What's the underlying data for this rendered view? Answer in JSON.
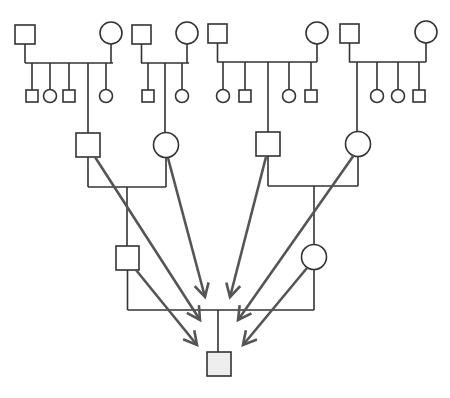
{
  "diagram": {
    "type": "pedigree",
    "colors": {
      "line": "#333333",
      "arrow": "#555555",
      "proband_fill": "#eeeeee",
      "background": "#ffffff"
    },
    "generation1": [
      {
        "id": "f1",
        "father": {
          "x": 15,
          "y": 25,
          "w": 20,
          "h": 19
        },
        "mother": {
          "cx": 111,
          "cy": 33,
          "r": 11
        },
        "sibline": {
          "y": 63,
          "x1": 25,
          "x2": 113
        },
        "children": [
          {
            "type": "male",
            "x": 32
          },
          {
            "type": "female",
            "x": 50
          },
          {
            "type": "male",
            "x": 69
          },
          {
            "type": "link",
            "x": 88
          },
          {
            "type": "female",
            "x": 106
          }
        ]
      },
      {
        "id": "f2",
        "father": {
          "x": 132,
          "y": 25,
          "w": 19,
          "h": 19
        },
        "mother": {
          "cx": 187,
          "cy": 33,
          "r": 11
        },
        "sibline": {
          "y": 63,
          "x1": 141,
          "x2": 189
        },
        "children": [
          {
            "type": "male",
            "x": 148
          },
          {
            "type": "link",
            "x": 165
          },
          {
            "type": "female",
            "x": 182
          }
        ]
      },
      {
        "id": "f3",
        "father": {
          "x": 208,
          "y": 24,
          "w": 19,
          "h": 19
        },
        "mother": {
          "cx": 317,
          "cy": 33,
          "r": 11
        },
        "sibline": {
          "y": 62,
          "x1": 217,
          "x2": 317
        },
        "children": [
          {
            "type": "female",
            "x": 223
          },
          {
            "type": "male",
            "x": 245
          },
          {
            "type": "link",
            "x": 268
          },
          {
            "type": "female",
            "x": 289
          },
          {
            "type": "male",
            "x": 311
          }
        ]
      },
      {
        "id": "f4",
        "father": {
          "x": 340,
          "y": 24,
          "w": 19,
          "h": 19
        },
        "mother": {
          "cx": 426,
          "cy": 32,
          "r": 11
        },
        "sibline": {
          "y": 62,
          "x1": 349,
          "x2": 426
        },
        "children": [
          {
            "type": "link",
            "x": 357
          },
          {
            "type": "female",
            "x": 377
          },
          {
            "type": "female",
            "x": 398
          },
          {
            "type": "male",
            "x": 419
          }
        ]
      }
    ],
    "generation2": {
      "left": {
        "father": {
          "x": 76,
          "y": 133,
          "w": 24,
          "h": 24
        },
        "mother": {
          "cx": 166,
          "cy": 145,
          "r": 12.5
        },
        "line_y": 187,
        "drop_x": 127
      },
      "right": {
        "father": {
          "x": 256,
          "y": 132,
          "w": 24,
          "h": 24
        },
        "mother": {
          "cx": 358,
          "cy": 144,
          "r": 12.5
        },
        "line_y": 186,
        "drop_x": 314
      }
    },
    "generation3": {
      "father": {
        "x": 116,
        "y": 246,
        "w": 23,
        "h": 24
      },
      "mother": {
        "cx": 314,
        "cy": 257,
        "r": 12.5
      },
      "line_y": 310,
      "drop_x": 218
    },
    "proband": {
      "x": 207,
      "y": 352,
      "w": 24,
      "h": 24,
      "label": "proband"
    },
    "arrows": [
      {
        "from": [
          95,
          157
        ],
        "to": [
          200,
          320
        ]
      },
      {
        "from": [
          168,
          158
        ],
        "to": [
          205,
          297
        ]
      },
      {
        "from": [
          266,
          157
        ],
        "to": [
          230,
          297
        ]
      },
      {
        "from": [
          354,
          155
        ],
        "to": [
          238,
          320
        ]
      },
      {
        "from": [
          136,
          270
        ],
        "to": [
          197,
          345
        ]
      },
      {
        "from": [
          307,
          268
        ],
        "to": [
          243,
          345
        ]
      }
    ]
  }
}
